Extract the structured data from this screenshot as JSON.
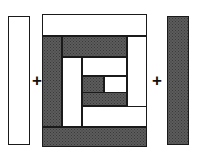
{
  "figure": {
    "width": 197,
    "height": 161,
    "background_color": "#ffffff",
    "operators": [
      {
        "symbol": "+",
        "name": "plus-operator-left",
        "x": 32,
        "y": 72
      },
      {
        "symbol": "+",
        "name": "plus-operator-right",
        "x": 152,
        "y": 72
      }
    ],
    "colors": {
      "light_fabric": "#ffffff",
      "dark_fabric": "#5c5c5c",
      "outline": "#1a1a1a"
    }
  },
  "left_strip": {
    "label": "light-strip",
    "fabric": "light",
    "x": 8,
    "y": 16,
    "width": 22,
    "height": 129
  },
  "right_strip": {
    "label": "dark-strip",
    "fabric": "dark",
    "x": 167,
    "y": 16,
    "width": 22,
    "height": 129
  },
  "block": {
    "label": "log-cabin-block",
    "x": 42,
    "y": 14,
    "width": 105,
    "height": 133,
    "pieces": [
      {
        "name": "round3-top-light",
        "fabric": "light",
        "x": 0,
        "y": 0,
        "width": 105,
        "height": 22
      },
      {
        "name": "round3-left-dark",
        "fabric": "dark",
        "x": 0,
        "y": 22,
        "width": 20,
        "height": 91
      },
      {
        "name": "round3-bottom-dark",
        "fabric": "dark",
        "x": 0,
        "y": 113,
        "width": 105,
        "height": 20
      },
      {
        "name": "round3-right-light",
        "fabric": "light",
        "x": 85,
        "y": 22,
        "width": 20,
        "height": 91
      },
      {
        "name": "round2-top-dark",
        "fabric": "dark",
        "x": 20,
        "y": 22,
        "width": 65,
        "height": 21
      },
      {
        "name": "round2-left-light",
        "fabric": "light",
        "x": 20,
        "y": 43,
        "width": 20,
        "height": 70
      },
      {
        "name": "round2-bottom-light",
        "fabric": "light",
        "x": 40,
        "y": 92,
        "width": 65,
        "height": 21
      },
      {
        "name": "round2-right-dark",
        "fabric": "dark",
        "x": 65,
        "y": 43,
        "width": 20,
        "height": 49
      },
      {
        "name": "round1-top-light",
        "fabric": "light",
        "x": 40,
        "y": 43,
        "width": 45,
        "height": 19
      },
      {
        "name": "round1-left-dark",
        "fabric": "dark",
        "x": 40,
        "y": 62,
        "width": 20,
        "height": 30
      },
      {
        "name": "round1-bottom-dark",
        "fabric": "dark",
        "x": 40,
        "y": 78,
        "width": 45,
        "height": 14
      },
      {
        "name": "center-square-dark",
        "fabric": "dark",
        "x": 40,
        "y": 62,
        "width": 22,
        "height": 17
      },
      {
        "name": "center-square-light",
        "fabric": "light",
        "x": 62,
        "y": 62,
        "width": 23,
        "height": 17
      }
    ]
  }
}
